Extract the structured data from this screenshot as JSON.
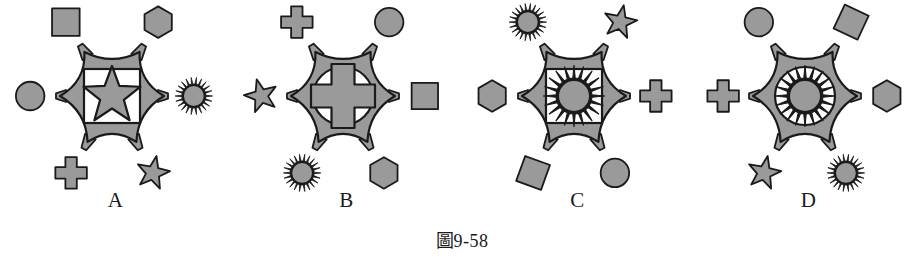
{
  "page": {
    "background_color": "#ffffff",
    "caption_prefix": "圖",
    "caption_number": "9-58",
    "caption_full": "圖 9-58"
  },
  "palette": {
    "body_fill": "#9a9a9a",
    "outline": "#1a1a1a",
    "inner_window_fill": "#ffffff",
    "text_color": "#1a1a1a"
  },
  "figures": [
    {
      "label": "A",
      "center_window": "square",
      "center_motif": "star",
      "arms": [
        {
          "position": "top-left",
          "shape": "square"
        },
        {
          "position": "top-right",
          "shape": "hexagon"
        },
        {
          "position": "left",
          "shape": "circle"
        },
        {
          "position": "right",
          "shape": "starburst"
        },
        {
          "position": "bottom-left",
          "shape": "cross"
        },
        {
          "position": "bottom-right",
          "shape": "star"
        }
      ]
    },
    {
      "label": "B",
      "center_window": "circle",
      "center_motif": "cross",
      "arms": [
        {
          "position": "top-left",
          "shape": "cross"
        },
        {
          "position": "top-right",
          "shape": "circle"
        },
        {
          "position": "left",
          "shape": "star"
        },
        {
          "position": "right",
          "shape": "diamond"
        },
        {
          "position": "bottom-left",
          "shape": "starburst"
        },
        {
          "position": "bottom-right",
          "shape": "hexagon"
        }
      ]
    },
    {
      "label": "C",
      "center_window": "square",
      "center_motif": "starburst",
      "arms": [
        {
          "position": "top-left",
          "shape": "starburst"
        },
        {
          "position": "top-right",
          "shape": "star"
        },
        {
          "position": "left",
          "shape": "hexagon"
        },
        {
          "position": "right",
          "shape": "cross"
        },
        {
          "position": "bottom-left",
          "shape": "diamond"
        },
        {
          "position": "bottom-right",
          "shape": "circle"
        }
      ]
    },
    {
      "label": "D",
      "center_window": "circle",
      "center_motif": "starburst",
      "arms": [
        {
          "position": "top-left",
          "shape": "circle"
        },
        {
          "position": "top-right",
          "shape": "diamond"
        },
        {
          "position": "left",
          "shape": "cross"
        },
        {
          "position": "right",
          "shape": "hexagon"
        },
        {
          "position": "bottom-left",
          "shape": "star"
        },
        {
          "position": "bottom-right",
          "shape": "starburst"
        }
      ]
    }
  ]
}
